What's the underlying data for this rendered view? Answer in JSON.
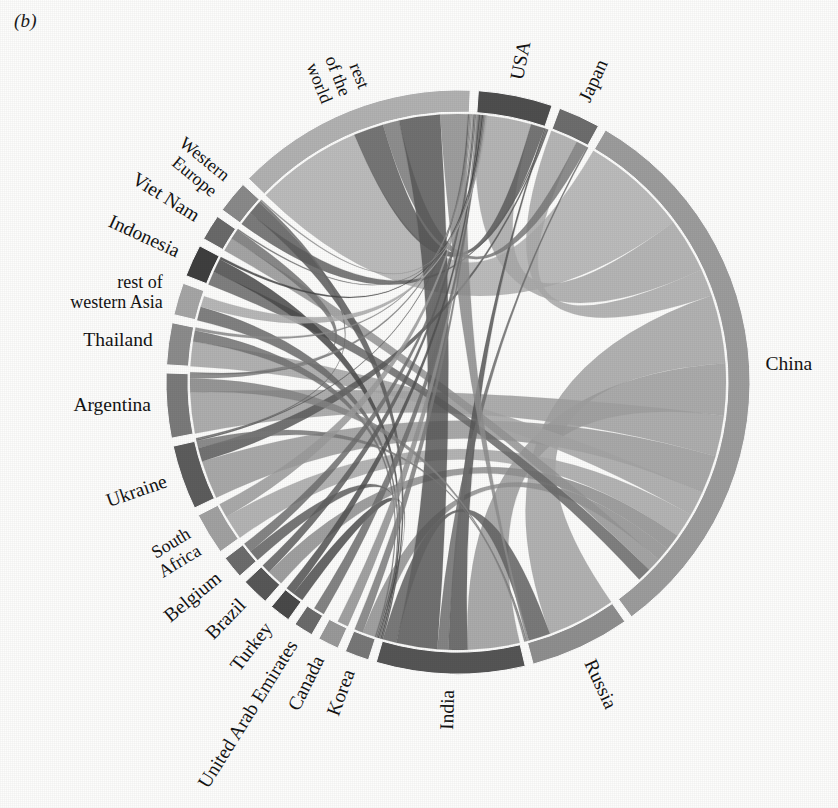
{
  "figure": {
    "panel_label": "(b)",
    "type": "chord-diagram",
    "background_color": "#fdfdfc"
  },
  "chart_data": {
    "type": "chord",
    "title": "",
    "subtitle": "",
    "xlabel": "",
    "ylabel": "",
    "legend_position": "none",
    "grid": false,
    "center": {
      "x": 458,
      "y": 382
    },
    "radius_outer": 292,
    "radius_inner": 268,
    "gap_degrees": 1.6,
    "start_angle_degrees": -86,
    "direction": "clockwise",
    "nodes": [
      {
        "name": "USA",
        "label": "USA",
        "value": 46,
        "color": "#4f4f4f",
        "label_mode": "radial",
        "label_lines": [
          "USA"
        ]
      },
      {
        "name": "Japan",
        "label": "Japan",
        "value": 26,
        "color": "#6e6e6e",
        "label_mode": "radial",
        "label_lines": [
          "Japan"
        ]
      },
      {
        "name": "China",
        "label": "China",
        "value": 352,
        "color": "#9d9d9d",
        "label_mode": "horizontal",
        "label_lines": [
          "China"
        ]
      },
      {
        "name": "Russia",
        "label": "Russia",
        "value": 62,
        "color": "#8f8f8f",
        "label_mode": "radial",
        "label_lines": [
          "Russia"
        ]
      },
      {
        "name": "India",
        "label": "India",
        "value": 92,
        "color": "#565656",
        "label_mode": "radial",
        "label_lines": [
          "India"
        ]
      },
      {
        "name": "Korea",
        "label": "Korea",
        "value": 15,
        "color": "#787878",
        "label_mode": "radial",
        "label_lines": [
          "Korea"
        ]
      },
      {
        "name": "Canada",
        "label": "Canada",
        "value": 13,
        "color": "#9a9a9a",
        "label_mode": "radial",
        "label_lines": [
          "Canada"
        ]
      },
      {
        "name": "United Arab Emirates",
        "label": "United Arab Emirates",
        "value": 12,
        "color": "#6b6b6b",
        "label_mode": "radial",
        "label_lines": [
          "United Arab Emirates"
        ]
      },
      {
        "name": "Turkey",
        "label": "Turkey",
        "value": 13,
        "color": "#4a4a4a",
        "label_mode": "radial",
        "label_lines": [
          "Turkey"
        ]
      },
      {
        "name": "Brazil",
        "label": "Brazil",
        "value": 17,
        "color": "#585858",
        "label_mode": "radial",
        "label_lines": [
          "Brazil"
        ]
      },
      {
        "name": "Belgium",
        "label": "Belgium",
        "value": 14,
        "color": "#6d6d6d",
        "label_mode": "radial",
        "label_lines": [
          "Belgium"
        ]
      },
      {
        "name": "South Africa",
        "label": "South Africa",
        "value": 26,
        "color": "#a2a2a2",
        "label_mode": "radial",
        "label_lines": [
          "South",
          "Africa"
        ]
      },
      {
        "name": "Ukraine",
        "label": "Ukraine",
        "value": 40,
        "color": "#5d5d5d",
        "label_mode": "radial",
        "label_lines": [
          "Ukraine"
        ]
      },
      {
        "name": "Argentina",
        "label": "Argentina",
        "value": 40,
        "color": "#7b7b7b",
        "label_mode": "horizontal",
        "label_lines": [
          "Argentina"
        ]
      },
      {
        "name": "Thailand",
        "label": "Thailand",
        "value": 26,
        "color": "#8c8c8c",
        "label_mode": "horizontal",
        "label_lines": [
          "Thailand"
        ]
      },
      {
        "name": "rest of western Asia",
        "label": "rest of western Asia",
        "value": 20,
        "color": "#a6a6a6",
        "label_mode": "horizontal",
        "label_lines": [
          "rest of",
          "western Asia"
        ]
      },
      {
        "name": "Indonesia",
        "label": "Indonesia",
        "value": 20,
        "color": "#3f3f3f",
        "label_mode": "radial",
        "label_lines": [
          "Indonesia"
        ]
      },
      {
        "name": "Viet Nam",
        "label": "Viet Nam",
        "value": 16,
        "color": "#6a6a6a",
        "label_mode": "radial",
        "label_lines": [
          "Viet Nam"
        ]
      },
      {
        "name": "Western Europe",
        "label": "Western Europe",
        "value": 20,
        "color": "#8a8a8a",
        "label_mode": "radial",
        "label_lines": [
          "Western",
          "Europe"
        ]
      },
      {
        "name": "rest of the world",
        "label": "rest of the world",
        "value": 150,
        "color": "#b2b2b2",
        "label_mode": "radial",
        "label_lines": [
          "rest",
          "of the",
          "world"
        ]
      }
    ],
    "links": [
      {
        "source": "China",
        "target": "rest of the world",
        "value": 78,
        "color": "#b0b0b0"
      },
      {
        "source": "China",
        "target": "USA",
        "value": 40,
        "color": "#a8a8a8"
      },
      {
        "source": "China",
        "target": "Japan",
        "value": 20,
        "color": "#a9a9a9"
      },
      {
        "source": "China",
        "target": "Russia",
        "value": 50,
        "color": "#a4a4a4"
      },
      {
        "source": "China",
        "target": "India",
        "value": 38,
        "color": "#9c9c9c"
      },
      {
        "source": "China",
        "target": "Argentina",
        "value": 30,
        "color": "#a0a0a0"
      },
      {
        "source": "China",
        "target": "Ukraine",
        "value": 28,
        "color": "#9a9a9a"
      },
      {
        "source": "China",
        "target": "Thailand",
        "value": 18,
        "color": "#a5a5a5"
      },
      {
        "source": "China",
        "target": "South Africa",
        "value": 18,
        "color": "#a7a7a7"
      },
      {
        "source": "China",
        "target": "Brazil",
        "value": 12,
        "color": "#8f8f8f"
      },
      {
        "source": "China",
        "target": "Korea",
        "value": 10,
        "color": "#909090"
      },
      {
        "source": "China",
        "target": "Viet Nam",
        "value": 10,
        "color": "#959595"
      },
      {
        "source": "China",
        "target": "Indonesia",
        "value": 10,
        "color": "#6a6a6a"
      },
      {
        "source": "USA",
        "target": "rest of the world",
        "value": 22,
        "color": "#5e5e5e"
      },
      {
        "source": "USA",
        "target": "India",
        "value": 14,
        "color": "#585858"
      },
      {
        "source": "USA",
        "target": "Western Europe",
        "value": 10,
        "color": "#656565"
      },
      {
        "source": "USA",
        "target": "Ukraine",
        "value": 10,
        "color": "#5a5a5a"
      },
      {
        "source": "Japan",
        "target": "rest of the world",
        "value": 12,
        "color": "#7a7a7a"
      },
      {
        "source": "Japan",
        "target": "India",
        "value": 8,
        "color": "#6f6f6f"
      },
      {
        "source": "India",
        "target": "rest of the world",
        "value": 30,
        "color": "#585858"
      },
      {
        "source": "India",
        "target": "Russia",
        "value": 16,
        "color": "#636363"
      },
      {
        "source": "India",
        "target": "Western Europe",
        "value": 10,
        "color": "#5c5c5c"
      },
      {
        "source": "India",
        "target": "Indonesia",
        "value": 10,
        "color": "#494949"
      },
      {
        "source": "India",
        "target": "rest of western Asia",
        "value": 10,
        "color": "#6b6b6b"
      },
      {
        "source": "India",
        "target": "Turkey",
        "value": 8,
        "color": "#4e4e4e"
      },
      {
        "source": "India",
        "target": "Belgium",
        "value": 8,
        "color": "#606060"
      },
      {
        "source": "India",
        "target": "Thailand",
        "value": 8,
        "color": "#727272"
      },
      {
        "source": "Russia",
        "target": "rest of the world",
        "value": 20,
        "color": "#8d8d8d"
      },
      {
        "source": "Russia",
        "target": "Ukraine",
        "value": 12,
        "color": "#787878"
      },
      {
        "source": "Russia",
        "target": "Argentina",
        "value": 10,
        "color": "#858585"
      },
      {
        "source": "Ukraine",
        "target": "rest of the world",
        "value": 14,
        "color": "#606060"
      },
      {
        "source": "Ukraine",
        "target": "Western Europe",
        "value": 8,
        "color": "#6c6c6c"
      },
      {
        "source": "Argentina",
        "target": "rest of the world",
        "value": 14,
        "color": "#7e7e7e"
      },
      {
        "source": "Argentina",
        "target": "Viet Nam",
        "value": 8,
        "color": "#747474"
      },
      {
        "source": "Thailand",
        "target": "rest of the world",
        "value": 10,
        "color": "#8a8a8a"
      },
      {
        "source": "South Africa",
        "target": "rest of the world",
        "value": 12,
        "color": "#9b9b9b"
      },
      {
        "source": "Brazil",
        "target": "rest of the world",
        "value": 8,
        "color": "#5f5f5f"
      },
      {
        "source": "Belgium",
        "target": "rest of the world",
        "value": 8,
        "color": "#707070"
      },
      {
        "source": "Canada",
        "target": "rest of the world",
        "value": 8,
        "color": "#929292"
      },
      {
        "source": "Korea",
        "target": "rest of the world",
        "value": 8,
        "color": "#7d7d7d"
      },
      {
        "source": "Turkey",
        "target": "rest of the world",
        "value": 8,
        "color": "#515151"
      },
      {
        "source": "United Arab Emirates",
        "target": "rest of the world",
        "value": 8,
        "color": "#6e6e6e"
      },
      {
        "source": "Indonesia",
        "target": "rest of the world",
        "value": 8,
        "color": "#454545"
      },
      {
        "source": "Viet Nam",
        "target": "rest of the world",
        "value": 8,
        "color": "#6f6f6f"
      },
      {
        "source": "Western Europe",
        "target": "rest of the world",
        "value": 10,
        "color": "#8e8e8e"
      },
      {
        "source": "rest of western Asia",
        "target": "rest of the world",
        "value": 8,
        "color": "#ababab"
      }
    ]
  }
}
